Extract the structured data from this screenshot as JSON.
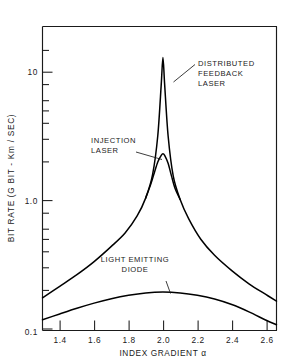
{
  "chart_data": {
    "type": "line",
    "title": "",
    "xlabel": "INDEX GRADIENT α",
    "ylabel": "BIT RATE  (G BIT - Km / SEC)",
    "xlim": [
      1.3,
      2.66
    ],
    "ylim": [
      0.1,
      20
    ],
    "yscale": "log",
    "xscale": "linear",
    "grid": false,
    "legend": "annotations-inline",
    "xticks": [
      "1.4",
      "1.6",
      "1.8",
      "2.0",
      "2.2",
      "2.4",
      "2.6"
    ],
    "xtick_values": [
      1.4,
      1.6,
      1.8,
      2.0,
      2.2,
      2.4,
      2.6
    ],
    "yticks_labeled": [
      "0.1",
      "1.0",
      "10"
    ],
    "ytick_values_labeled": [
      0.1,
      1.0,
      10
    ],
    "yticks_minor": [
      0.2,
      0.3,
      0.4,
      0.5,
      0.6,
      0.8,
      2,
      3,
      4,
      5,
      6,
      8,
      20
    ],
    "series": [
      {
        "name": "DISTRIBUTED FEEDBACK LASER",
        "color": "#000000",
        "x": [
          1.3,
          1.4,
          1.5,
          1.6,
          1.7,
          1.78,
          1.85,
          1.9,
          1.94,
          1.97,
          1.99,
          2.0,
          2.01,
          2.03,
          2.06,
          2.1,
          2.15,
          2.22,
          2.3,
          2.4,
          2.5,
          2.6,
          2.66
        ],
        "y": [
          0.175,
          0.215,
          0.265,
          0.335,
          0.44,
          0.56,
          0.76,
          1.05,
          1.6,
          3.2,
          8.0,
          13.0,
          8.0,
          3.2,
          1.55,
          1.02,
          0.72,
          0.5,
          0.375,
          0.285,
          0.225,
          0.185,
          0.165
        ]
      },
      {
        "name": "INJECTION LASER",
        "color": "#000000",
        "x": [
          1.9,
          1.93,
          1.95,
          1.97,
          1.99,
          2.0,
          2.01,
          2.03,
          2.05,
          2.07,
          2.1
        ],
        "y": [
          1.05,
          1.35,
          1.65,
          2.0,
          2.25,
          2.32,
          2.25,
          1.95,
          1.55,
          1.25,
          1.02
        ]
      },
      {
        "name": "LIGHT EMITTING DIODE",
        "color": "#000000",
        "x": [
          1.3,
          1.4,
          1.5,
          1.6,
          1.7,
          1.8,
          1.9,
          2.0,
          2.1,
          2.2,
          2.3,
          2.4,
          2.5,
          2.6,
          2.66
        ],
        "y": [
          0.118,
          0.131,
          0.145,
          0.159,
          0.172,
          0.183,
          0.191,
          0.194,
          0.191,
          0.183,
          0.171,
          0.155,
          0.136,
          0.117,
          0.108
        ]
      }
    ],
    "annotations": [
      {
        "name": "distributed-feedback-laser-label",
        "lines": [
          "DISTRIBUTED",
          "FEEDBACK",
          "LASER"
        ],
        "points_to": {
          "x": 2.0,
          "y": 8.6
        }
      },
      {
        "name": "injection-laser-label",
        "lines": [
          "INJECTION",
          "LASER"
        ],
        "points_to": {
          "x": 2.0,
          "y": 2.3
        }
      },
      {
        "name": "light-emitting-diode-label",
        "lines": [
          "LIGHT  EMITTING",
          "DIODE"
        ],
        "points_to": {
          "x": 2.05,
          "y": 0.193
        }
      }
    ]
  },
  "axis": {
    "y_title": "BIT RATE  (G BIT - Km / SEC)",
    "x_title": "INDEX GRADIENT  α",
    "ytick_10": "10",
    "ytick_1": "1.0",
    "ytick_01": "0.1",
    "xtick_14": "1.4",
    "xtick_16": "1.6",
    "xtick_18": "1.8",
    "xtick_20": "2.0",
    "xtick_22": "2.2",
    "xtick_24": "2.4",
    "xtick_26": "2.6"
  },
  "annotation_text": {
    "dfb_l1": "DISTRIBUTED",
    "dfb_l2": "FEEDBACK",
    "dfb_l3": "LASER",
    "inj_l1": "INJECTION",
    "inj_l2": "LASER",
    "led_l1": "LIGHT  EMITTING",
    "led_l2": "DIODE"
  },
  "colors": {
    "curve": "#000000",
    "frame": "#1a1a1a",
    "text": "#1a1a1a",
    "background": "#ffffff"
  }
}
